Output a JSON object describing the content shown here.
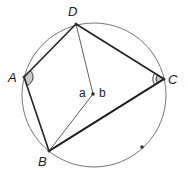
{
  "diagram": {
    "title": "",
    "colors": {
      "circle": "#777777",
      "quad": "#222222",
      "radius": "#333333",
      "angle_fill": "#c8c8c8",
      "point": "#333333"
    },
    "circle": {
      "cx": 94,
      "cy": 95,
      "r": 72
    },
    "points": {
      "D": {
        "x": 76,
        "y": 24,
        "label": "D",
        "lx": 68,
        "ly": 5
      },
      "A": {
        "x": 24,
        "y": 77,
        "label": "A",
        "lx": 8,
        "ly": 71
      },
      "C": {
        "x": 164,
        "y": 79,
        "label": "C",
        "lx": 168,
        "ly": 73
      },
      "B": {
        "x": 49,
        "y": 151,
        "label": "B",
        "lx": 38,
        "ly": 155
      },
      "O": {
        "x": 93,
        "y": 94,
        "label": ""
      },
      "E": {
        "x": 142,
        "y": 147,
        "label": ""
      }
    },
    "center_labels": {
      "left": "a",
      "right": "b"
    },
    "quadrilateral": [
      "A",
      "D",
      "C",
      "B"
    ],
    "diagonal": [
      "B",
      "C"
    ],
    "radii": [
      [
        "D",
        "O"
      ],
      [
        "O",
        "B"
      ]
    ],
    "angle_marks": [
      {
        "vertex": "A",
        "arcs": 1,
        "filled": true
      },
      {
        "vertex": "C",
        "arcs": 2,
        "filled": true
      }
    ]
  }
}
